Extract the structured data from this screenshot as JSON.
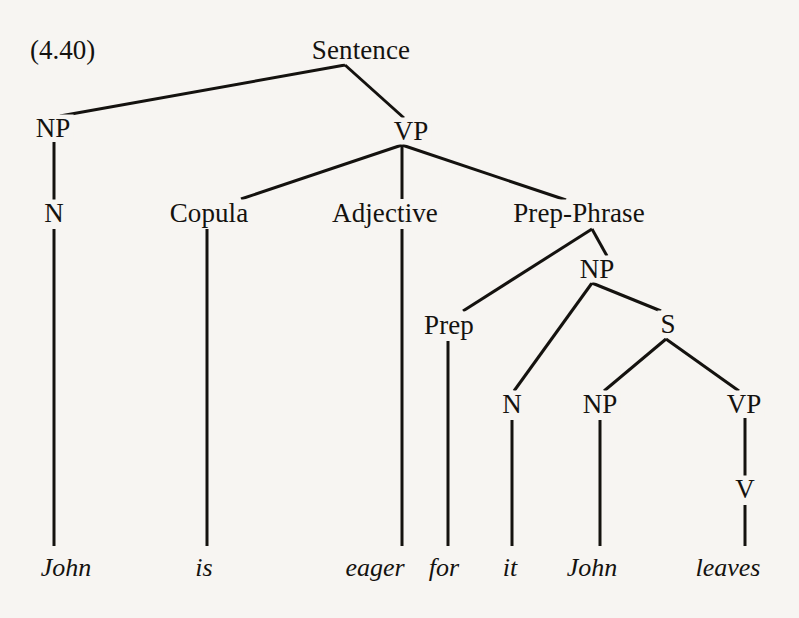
{
  "figure": {
    "example_number": "(4.40)",
    "sentence": "John is eager for it John leaves",
    "kind": "syntax-tree"
  },
  "nodes": {
    "sentence": {
      "label": "Sentence",
      "x": 361,
      "y": 50
    },
    "np_subject": {
      "label": "NP",
      "x": 53,
      "y": 128
    },
    "vp_main": {
      "label": "VP",
      "x": 411,
      "y": 131
    },
    "n_subject": {
      "label": "N",
      "x": 54,
      "y": 213
    },
    "copula": {
      "label": "Copula",
      "x": 209,
      "y": 213
    },
    "adjective": {
      "label": "Adjective",
      "x": 385,
      "y": 213
    },
    "prep_phrase": {
      "label": "Prep-Phrase",
      "x": 579,
      "y": 213
    },
    "np_embedded": {
      "label": "NP",
      "x": 597,
      "y": 269
    },
    "prep": {
      "label": "Prep",
      "x": 449,
      "y": 325
    },
    "s_embedded": {
      "label": "S",
      "x": 668,
      "y": 324
    },
    "n_it": {
      "label": "N",
      "x": 512,
      "y": 404
    },
    "np_john2": {
      "label": "NP",
      "x": 600,
      "y": 404
    },
    "vp_embedded": {
      "label": "VP",
      "x": 744,
      "y": 404
    },
    "v_leaves": {
      "label": "V",
      "x": 745,
      "y": 489
    }
  },
  "leaves": [
    {
      "word": "John",
      "x": 66,
      "y": 568
    },
    {
      "word": "is",
      "x": 204,
      "y": 568
    },
    {
      "word": "eager",
      "x": 375,
      "y": 568
    },
    {
      "word": "for",
      "x": 444,
      "y": 568
    },
    {
      "word": "it",
      "x": 510,
      "y": 568
    },
    {
      "word": "John",
      "x": 592,
      "y": 568
    },
    {
      "word": "leaves",
      "x": 728,
      "y": 568
    }
  ],
  "edges": [
    {
      "from": "sentence",
      "to": "np_subject",
      "x1": 345,
      "y1": 65,
      "x2": 60,
      "y2": 116
    },
    {
      "from": "sentence",
      "to": "vp_main",
      "x1": 345,
      "y1": 65,
      "x2": 404,
      "y2": 118
    },
    {
      "from": "vp_main",
      "to": "copula",
      "x1": 402,
      "y1": 145,
      "x2": 241,
      "y2": 199
    },
    {
      "from": "vp_main",
      "to": "adjective",
      "x1": 402,
      "y1": 145,
      "x2": 402,
      "y2": 199
    },
    {
      "from": "vp_main",
      "to": "prep_phrase",
      "x1": 402,
      "y1": 145,
      "x2": 566,
      "y2": 200
    },
    {
      "from": "np_subject",
      "to": "n_subject",
      "x1": 54,
      "y1": 142,
      "x2": 54,
      "y2": 200
    },
    {
      "from": "prep_phrase",
      "to": "prep",
      "x1": 592,
      "y1": 229,
      "x2": 463,
      "y2": 311
    },
    {
      "from": "prep_phrase",
      "to": "np_embedded",
      "x1": 592,
      "y1": 229,
      "x2": 607,
      "y2": 256
    },
    {
      "from": "np_embedded",
      "to": "n_it",
      "x1": 592,
      "y1": 283,
      "x2": 514,
      "y2": 391
    },
    {
      "from": "np_embedded",
      "to": "s_embedded",
      "x1": 592,
      "y1": 283,
      "x2": 661,
      "y2": 311
    },
    {
      "from": "s_embedded",
      "to": "np_john2",
      "x1": 666,
      "y1": 339,
      "x2": 604,
      "y2": 391
    },
    {
      "from": "s_embedded",
      "to": "vp_embedded",
      "x1": 666,
      "y1": 339,
      "x2": 739,
      "y2": 391
    },
    {
      "from": "vp_embedded",
      "to": "v_leaves",
      "x1": 745,
      "y1": 418,
      "x2": 745,
      "y2": 476
    },
    {
      "from": "n_subject",
      "to": "leaf_john1",
      "x1": 54,
      "y1": 229,
      "x2": 54,
      "y2": 546
    },
    {
      "from": "copula",
      "to": "leaf_is",
      "x1": 207,
      "y1": 229,
      "x2": 207,
      "y2": 546
    },
    {
      "from": "adjective",
      "to": "leaf_eager",
      "x1": 402,
      "y1": 229,
      "x2": 402,
      "y2": 546
    },
    {
      "from": "prep",
      "to": "leaf_for",
      "x1": 448,
      "y1": 341,
      "x2": 448,
      "y2": 546
    },
    {
      "from": "n_it",
      "to": "leaf_it",
      "x1": 512,
      "y1": 420,
      "x2": 512,
      "y2": 546
    },
    {
      "from": "np_john2",
      "to": "leaf_john2",
      "x1": 600,
      "y1": 420,
      "x2": 600,
      "y2": 546
    },
    {
      "from": "v_leaves",
      "to": "leaf_leaves",
      "x1": 745,
      "y1": 505,
      "x2": 745,
      "y2": 546
    }
  ],
  "style": {
    "background": "#f7f5f2",
    "ink": "#14120f",
    "line_width": 3
  }
}
